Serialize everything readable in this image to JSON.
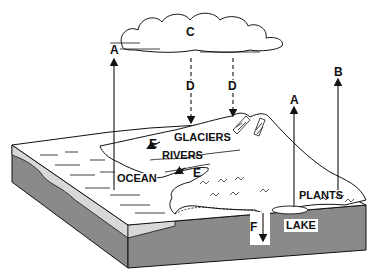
{
  "diagram": {
    "type": "water-cycle",
    "labels": {
      "glaciers": "GLACIERS",
      "rivers": "RIVERS",
      "ocean": "OCEAN",
      "plants": "PLANTS",
      "lake": "LAKE"
    },
    "arrows": {
      "a_ocean": "A",
      "a_lake": "A",
      "b": "B",
      "c": "C",
      "d_left": "D",
      "d_right": "D",
      "e_upper": "E",
      "e_lower": "E",
      "f": "F"
    },
    "colors": {
      "ink": "#111111",
      "ground": "#8a8a8a",
      "ocean_edge": "#d8d8d8",
      "background": "#ffffff"
    }
  }
}
